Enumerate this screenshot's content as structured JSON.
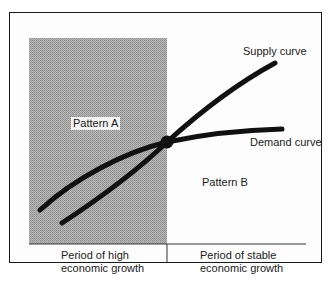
{
  "diagram": {
    "regions": {
      "left": {
        "label": "Pattern A",
        "period": "Period of high\neconomic growth",
        "period_lines": [
          "Period of high",
          "economic growth"
        ]
      },
      "right": {
        "label": "Pattern B",
        "period": "Period of stable\neconomic growth",
        "period_lines": [
          "Period of stable",
          "economic growth"
        ]
      }
    },
    "curves": {
      "supply": {
        "label": "Supply curve"
      },
      "demand": {
        "label": "Demand curve"
      }
    },
    "colors": {
      "curve": "#111111",
      "shading": "#a8a8a8",
      "frame": "#1a1a1a"
    }
  }
}
